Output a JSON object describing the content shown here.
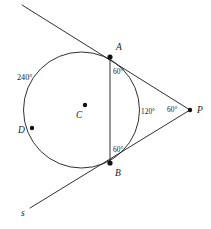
{
  "figure": {
    "background_color": "#ffffff",
    "stroke_color": "#1a1a1a",
    "width": 211,
    "height": 229
  },
  "points": {
    "A": {
      "label": "A",
      "x": 110,
      "y": 57,
      "label_x": 116,
      "label_y": 50
    },
    "B": {
      "label": "B",
      "x": 110,
      "y": 163,
      "label_x": 115,
      "label_y": 176
    },
    "C": {
      "label": "C",
      "x": 85,
      "y": 105,
      "label_x": 76,
      "label_y": 118
    },
    "D": {
      "label": "D",
      "x": 32,
      "y": 128,
      "label_x": 18,
      "label_y": 133
    },
    "P": {
      "label": "P",
      "x": 190,
      "y": 110,
      "label_x": 197,
      "label_y": 113
    }
  },
  "circle": {
    "center_x": 81.5,
    "center_y": 110,
    "radius": 58
  },
  "lines": {
    "tangent_upper": {
      "x1": 22,
      "y1": 5,
      "x2": 190,
      "y2": 110
    },
    "tangent_lower": {
      "x1": 30,
      "y1": 208,
      "x2": 190,
      "y2": 110
    },
    "chord_ab": {
      "x1": 110,
      "y1": 57,
      "x2": 110,
      "y2": 163
    }
  },
  "labels": {
    "arc_major": {
      "text": "240°",
      "x": 17,
      "y": 80
    },
    "angle_at_a": {
      "text": "60°",
      "x": 113,
      "y": 74
    },
    "angle_at_b": {
      "text": "60°",
      "x": 113,
      "y": 152
    },
    "angle_center": {
      "text": "120°",
      "x": 141,
      "y": 114
    },
    "angle_at_p": {
      "text": "60°",
      "x": 167,
      "y": 112
    },
    "line_s": {
      "text": "s",
      "x": 21,
      "y": 216
    }
  }
}
